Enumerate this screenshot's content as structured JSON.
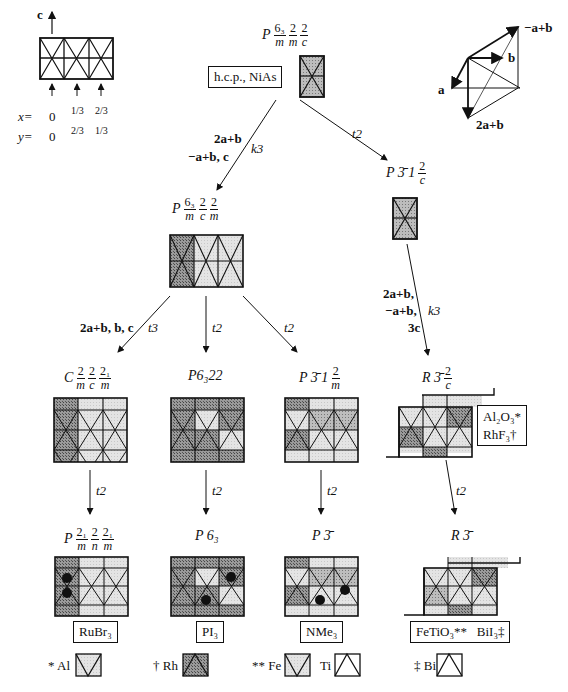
{
  "header": {
    "axis_c_label": "c",
    "x_label": "x=",
    "y_label": "y=",
    "x_values": [
      "0",
      "1/3",
      "2/3"
    ],
    "y_values": [
      "0",
      "2/3",
      "1/3"
    ],
    "vectors": {
      "a": "a",
      "b": "b",
      "minus_a_plus_b": "−a+b",
      "two_a_plus_b": "2a+b"
    }
  },
  "nodes": {
    "root": {
      "symbol": "P",
      "parts": [
        {
          "num": "6₃",
          "den": "m"
        },
        {
          "num": "2",
          "den": "m"
        },
        {
          "num": "2",
          "den": "c"
        }
      ],
      "tag": "h.c.p., NiAs"
    },
    "p63mcm": {
      "symbol": "P",
      "parts": [
        {
          "num": "6₃",
          "den": "m"
        },
        {
          "num": "2",
          "den": "c"
        },
        {
          "num": "2",
          "den": "m"
        }
      ]
    },
    "p31c": {
      "symbol": "P 3̄ 1",
      "parts": [
        {
          "num": "2",
          "den": "c"
        }
      ]
    },
    "cmcm": {
      "symbol": "C",
      "parts": [
        {
          "num": "2",
          "den": "m"
        },
        {
          "num": "2",
          "den": "c"
        },
        {
          "num": "2₁",
          "den": "m"
        }
      ]
    },
    "p6322": {
      "symbol": "P6₃22"
    },
    "p31m": {
      "symbol": "P 3̄ 1",
      "parts": [
        {
          "num": "2",
          "den": "m"
        }
      ]
    },
    "r3c": {
      "symbol": "R 3̄",
      "parts": [
        {
          "num": "2",
          "den": "c"
        }
      ],
      "tag_lines": [
        "Al₂O₃*",
        "RhF₃†"
      ]
    },
    "pmnm": {
      "symbol": "P",
      "parts": [
        {
          "num": "2₁",
          "den": "m"
        },
        {
          "num": "2",
          "den": "n"
        },
        {
          "num": "2₁",
          "den": "m"
        }
      ],
      "tag": "RuBr₃"
    },
    "p63": {
      "symbol": "P 6₃",
      "tag": "PI₃"
    },
    "p3": {
      "symbol": "P 3̄",
      "tag": "NMe₃"
    },
    "r3": {
      "symbol": "R 3̄",
      "tag_a": "FeTiO₃**",
      "tag_b": "BiI₃‡"
    }
  },
  "edges": {
    "root_to_p63mcm": {
      "basis_1": "2a+b",
      "basis_2": "−a+b, c",
      "index": "k3"
    },
    "root_to_p31c": {
      "index": "t2"
    },
    "p63mcm_to_cmcm": {
      "basis": "2a+b, b, c",
      "index": "t3"
    },
    "p63mcm_to_p6322": {
      "index": "t2"
    },
    "p63mcm_to_p31m": {
      "index": "t2"
    },
    "p31c_to_r3c": {
      "basis_1": "2a+b,",
      "basis_2": "−a+b,",
      "basis_3": "3c",
      "index": "k3"
    },
    "cmcm_to_pmnm": {
      "index": "t2"
    },
    "p6322_to_p63": {
      "index": "t2"
    },
    "p31m_to_p3": {
      "index": "t2"
    },
    "r3c_to_r3": {
      "index": "t2"
    }
  },
  "legend": [
    {
      "mark": "*",
      "element": "Al"
    },
    {
      "mark": "†",
      "element": "Rh"
    },
    {
      "mark": "**",
      "element": "Fe"
    },
    {
      "mark": "",
      "element": "Ti"
    },
    {
      "mark": "‡",
      "element": "Bi"
    }
  ]
}
